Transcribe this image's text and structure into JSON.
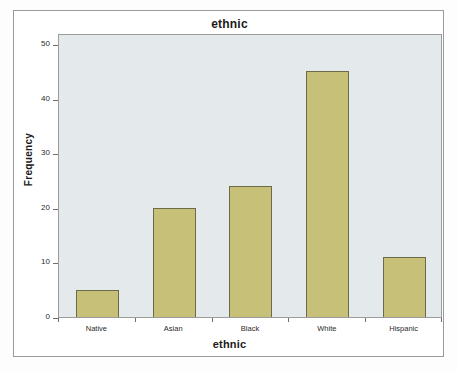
{
  "chart_data": {
    "type": "bar",
    "title": "ethnic",
    "xlabel": "ethnic",
    "ylabel": "Frequency",
    "categories": [
      "Native",
      "Asian",
      "Black",
      "White",
      "Hispanic"
    ],
    "values": [
      5,
      20,
      24,
      45,
      11
    ],
    "ylim": [
      0,
      52
    ],
    "yticks": [
      0,
      10,
      20,
      30,
      40,
      50
    ],
    "ytick_labels": [
      "0",
      "10",
      "20",
      "30",
      "40",
      "50"
    ],
    "grid": false,
    "legend": false,
    "bar_color": "#c7c079",
    "bar_border_color": "#6d6a49",
    "plot_background": "#e4e9ec",
    "frame_color": "#9a9a9a"
  }
}
